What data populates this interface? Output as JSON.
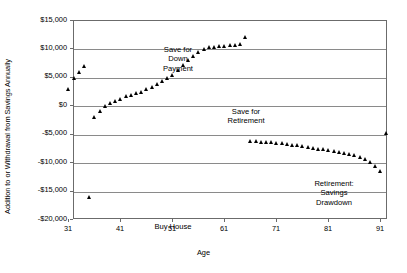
{
  "chart_data": {
    "type": "scatter",
    "title": "",
    "xlabel": "Age",
    "ylabel": "Addition to or Withdrawal from Savings Annually",
    "xlim": [
      31,
      93
    ],
    "ylim": [
      -20000,
      15000
    ],
    "grid": true,
    "legend": "none",
    "marker": "filled-triangle",
    "marker_color": "#000000",
    "xticks": [
      31,
      41,
      51,
      61,
      71,
      81,
      91
    ],
    "xtick_labels": [
      "31",
      "41",
      "51",
      "61",
      "71",
      "81",
      "91"
    ],
    "yticks": [
      15000,
      10000,
      5000,
      0,
      -5000,
      -10000,
      -15000,
      -20000
    ],
    "ytick_labels": [
      "$15,000",
      "$10,000",
      "$5,000",
      "$0",
      "-$5,000",
      "-$10,000",
      "-$15,000",
      "-$20,000"
    ],
    "series": [
      {
        "name": "Save for Down Payment",
        "x": [
          31,
          32,
          33,
          34
        ],
        "values": [
          3000,
          5000,
          5900,
          7100
        ]
      },
      {
        "name": "Buy House",
        "x": [
          35
        ],
        "values": [
          -16000
        ]
      },
      {
        "name": "Save for Retirement",
        "x": [
          36,
          37,
          38,
          39,
          40,
          41,
          42,
          43,
          44,
          45,
          46,
          47,
          48,
          49,
          50,
          51,
          52,
          53,
          54,
          55,
          56,
          57,
          58,
          59,
          60,
          61,
          62,
          63,
          64,
          65
        ],
        "values": [
          -2000,
          -900,
          0,
          500,
          900,
          1300,
          1700,
          1900,
          2300,
          2400,
          2900,
          3300,
          3900,
          4300,
          4900,
          5500,
          6400,
          7200,
          8000,
          8800,
          9500,
          10000,
          10300,
          10400,
          10500,
          10600,
          10700,
          10800,
          10900,
          12100
        ]
      },
      {
        "name": "Retirement: Savings Drawdown",
        "x": [
          66,
          67,
          68,
          69,
          70,
          71,
          72,
          73,
          74,
          75,
          76,
          77,
          78,
          79,
          80,
          81,
          82,
          83,
          84,
          85,
          86,
          87,
          88,
          89,
          90,
          91
        ],
        "values": [
          -6200,
          -6200,
          -6300,
          -6300,
          -6400,
          -6500,
          -6600,
          -6700,
          -6800,
          -6900,
          -7100,
          -7200,
          -7400,
          -7500,
          -7600,
          -7800,
          -7900,
          -8100,
          -8300,
          -8500,
          -8700,
          -9000,
          -9400,
          -9900,
          -10600,
          -11400
        ]
      },
      {
        "name": "Final Year",
        "x": [
          92
        ],
        "values": [
          -4800
        ]
      }
    ],
    "annotations": [
      {
        "id": "down_payment",
        "text": "Save for\nDown\nPayment"
      },
      {
        "id": "retirement",
        "text": "Save for\nRetirement"
      },
      {
        "id": "drawdown",
        "text": "Retirement:\nSavings\nDrawdown"
      },
      {
        "id": "buy_house",
        "text": "Buy House"
      }
    ]
  },
  "axes": {
    "y_title": "Addition to or Withdrawal from Savings Annually",
    "x_title": "Age"
  },
  "annotations": {
    "down_payment": "Save for\nDown\nPayment",
    "retirement": "Save for\nRetirement",
    "drawdown": "Retirement:\nSavings\nDrawdown",
    "buy_house": "Buy House"
  }
}
